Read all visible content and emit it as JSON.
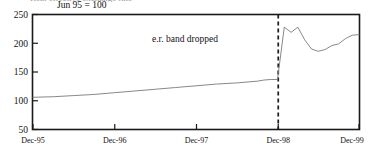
{
  "figure": {
    "clipped_title_fragment": "Real effective exchange rate",
    "subtitle": "Jun 95 = 100"
  },
  "chart_data": {
    "type": "line",
    "title": "",
    "subtitle": "Jun 95 = 100",
    "xlabel": "",
    "ylabel": "",
    "ylim": [
      50,
      250
    ],
    "yticks": [
      50,
      100,
      150,
      200,
      250
    ],
    "ytick_labels": [
      "50",
      "100",
      "150",
      "200",
      "250"
    ],
    "xlim": [
      "Dec-95",
      "Dec-99"
    ],
    "xticks": [
      "Dec-95",
      "Dec-96",
      "Dec-97",
      "Dec-98",
      "Dec-99"
    ],
    "xtick_labels": [
      "Dec-95",
      "Dec-96",
      "Dec-97",
      "Dec-98",
      "Dec-99"
    ],
    "grid": false,
    "legend": false,
    "annotations": [
      {
        "text": "e.r. band dropped",
        "x": "Jun-97",
        "y": 218
      }
    ],
    "markers": [
      {
        "type": "vline",
        "style": "dashed",
        "x": "Dec-98",
        "label": "e.r. band dropped"
      }
    ],
    "series": [
      {
        "name": "Index",
        "color": "#7a7a7a",
        "x": [
          "Dec-95",
          "Mar-96",
          "Jun-96",
          "Sep-96",
          "Dec-96",
          "Mar-97",
          "Jun-97",
          "Sep-97",
          "Dec-97",
          "Mar-98",
          "Jun-98",
          "Sep-98",
          "Oct-98",
          "Nov-98",
          "Dec-98",
          "Jan-99",
          "Feb-99",
          "Mar-99",
          "Apr-99",
          "May-99",
          "Jun-99",
          "Jul-99",
          "Aug-99",
          "Sep-99",
          "Oct-99",
          "Nov-99",
          "Dec-99"
        ],
        "values": [
          106,
          107,
          109,
          111,
          114,
          117,
          120,
          123,
          126,
          129,
          131,
          134,
          136,
          137,
          137,
          228,
          219,
          228,
          206,
          190,
          186,
          189,
          196,
          199,
          208,
          214,
          215
        ]
      }
    ]
  }
}
